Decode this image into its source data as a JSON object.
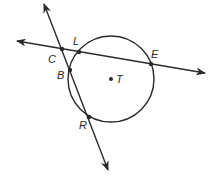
{
  "diagram": {
    "colors": {
      "stroke": "#2a2a2a",
      "background": "#ffffff"
    },
    "circle": {
      "name": "T",
      "center": [
        111,
        79
      ],
      "radius": 43
    },
    "points": {
      "C": {
        "label": "C",
        "x": 62,
        "y": 49
      },
      "L": {
        "label": "L",
        "x": 79,
        "y": 52
      },
      "E": {
        "label": "E",
        "x": 151,
        "y": 64
      },
      "B": {
        "label": "B",
        "x": 70,
        "y": 70
      },
      "R": {
        "label": "R",
        "x": 89,
        "y": 117
      },
      "T": {
        "label": "T",
        "x": 111,
        "y": 79
      }
    },
    "lines": [
      {
        "name": "line-CLE",
        "from": [
          17,
          41
        ],
        "to": [
          205,
          73
        ],
        "arrows": "both"
      },
      {
        "name": "line-CBR",
        "from": [
          44,
          4
        ],
        "to": [
          108,
          170
        ],
        "arrows": "both"
      }
    ]
  }
}
